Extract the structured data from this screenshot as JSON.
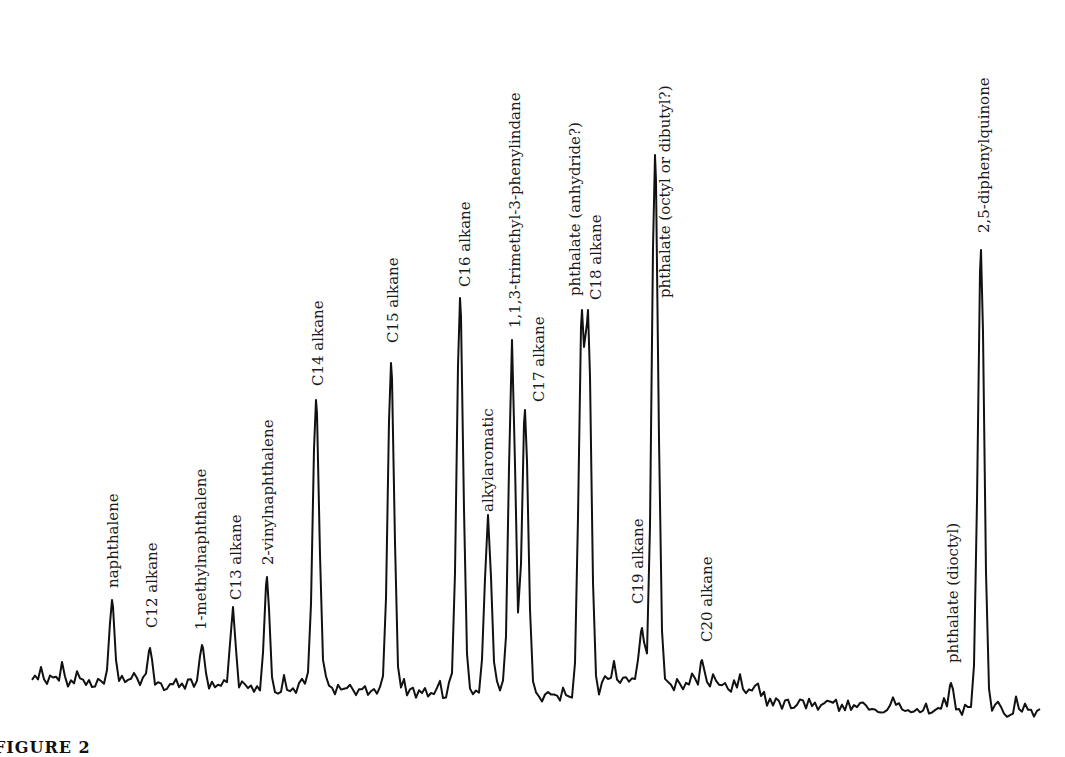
{
  "chart_data": {
    "type": "line",
    "title": "",
    "subtitle": "Gas chromatogram (total ion trace) with labeled peaks",
    "xlabel": "",
    "ylabel": "",
    "axes_visible": false,
    "grid": false,
    "legend": null,
    "baseline": {
      "start": [
        32,
        680
      ],
      "end": [
        1040,
        712
      ]
    },
    "peaks": [
      {
        "label": "naphthalene",
        "x": 112,
        "top_y": 600,
        "label_x": 118,
        "label_bottom_y": 588
      },
      {
        "label": "C12 alkane",
        "x": 150,
        "top_y": 648,
        "label_x": 157,
        "label_bottom_y": 628
      },
      {
        "label": "1-methylnaphthalene",
        "x": 202,
        "top_y": 645,
        "label_x": 206,
        "label_bottom_y": 630
      },
      {
        "label": "C13 alkane",
        "x": 233,
        "top_y": 607,
        "label_x": 241,
        "label_bottom_y": 600
      },
      {
        "label": "2-vinylnaphthalene",
        "x": 267,
        "top_y": 577,
        "label_x": 273,
        "label_bottom_y": 565
      },
      {
        "label": "C14 alkane",
        "x": 316,
        "top_y": 400,
        "label_x": 323,
        "label_bottom_y": 386
      },
      {
        "label": "C15 alkane",
        "x": 391,
        "top_y": 363,
        "label_x": 398,
        "label_bottom_y": 343
      },
      {
        "label": "C16 alkane",
        "x": 460,
        "top_y": 298,
        "label_x": 470,
        "label_bottom_y": 287
      },
      {
        "label": "alkylaromatic",
        "x": 488,
        "top_y": 515,
        "label_x": 493,
        "label_bottom_y": 512
      },
      {
        "label": "1,1,3-trimethyl-3-phenylindane",
        "x": 512,
        "top_y": 340,
        "label_x": 520,
        "label_bottom_y": 328
      },
      {
        "label": "C17 alkane",
        "x": 525,
        "top_y": 410,
        "label_x": 544,
        "label_bottom_y": 402
      },
      {
        "label": "phthalate (anhydride?)",
        "x": 582,
        "top_y": 310,
        "label_x": 580,
        "label_bottom_y": 296
      },
      {
        "label": "C18 alkane",
        "x": 588,
        "top_y": 310,
        "label_x": 601,
        "label_bottom_y": 300
      },
      {
        "label": "C19 alkane",
        "x": 642,
        "top_y": 628,
        "label_x": 643,
        "label_bottom_y": 604
      },
      {
        "label": "phthalate (octyl or dibutyl?)",
        "x": 655,
        "top_y": 155,
        "label_x": 670,
        "label_bottom_y": 298
      },
      {
        "label": "C20 alkane",
        "x": 702,
        "top_y": 660,
        "label_x": 712,
        "label_bottom_y": 642
      },
      {
        "label": "phthalate (dioctyl)",
        "x": 951,
        "top_y": 683,
        "label_x": 958,
        "label_bottom_y": 663
      },
      {
        "label": "2,5-diphenylquinone",
        "x": 981,
        "top_y": 250,
        "label_x": 989,
        "label_bottom_y": 233
      }
    ],
    "caption_partial": "FIGURE 2"
  },
  "caption": {
    "text": "FIGURE 2"
  }
}
